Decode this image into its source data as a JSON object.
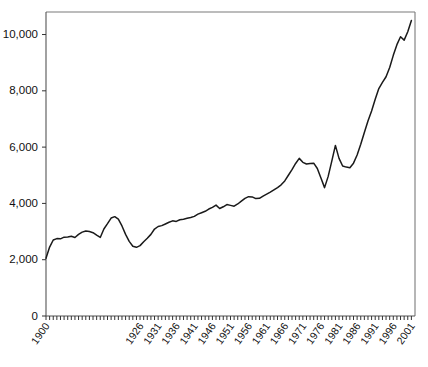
{
  "chart_data": {
    "type": "line",
    "title": "",
    "subtitle": "",
    "xlabel": "",
    "ylabel": "",
    "xlim": [
      1900,
      2002
    ],
    "ylim": [
      0,
      10800
    ],
    "grid": false,
    "legend": "none",
    "y_ticks": [
      0,
      2000,
      4000,
      6000,
      8000,
      10000
    ],
    "y_tick_labels": [
      "0",
      "2,000",
      "4,000",
      "6,000",
      "8,000",
      "10,000"
    ],
    "x_tick_labels": [
      "1900",
      "1926",
      "1931",
      "1936",
      "1941",
      "1946",
      "1951",
      "1956",
      "1961",
      "1966",
      "1971",
      "1976",
      "1981",
      "1986",
      "1991",
      "1996",
      "2001"
    ],
    "x_label_years": [
      1900,
      1926,
      1931,
      1936,
      1941,
      1946,
      1951,
      1956,
      1961,
      1966,
      1971,
      1976,
      1981,
      1986,
      1991,
      1996,
      2001
    ],
    "x_minor_tick_step": 1,
    "series": [
      {
        "name": "series-1",
        "color": "#1a1a1a",
        "x": [
          1900,
          1901,
          1902,
          1903,
          1904,
          1905,
          1906,
          1907,
          1908,
          1909,
          1910,
          1911,
          1912,
          1913,
          1914,
          1915,
          1916,
          1917,
          1918,
          1919,
          1920,
          1921,
          1922,
          1923,
          1924,
          1925,
          1926,
          1927,
          1928,
          1929,
          1930,
          1931,
          1932,
          1933,
          1934,
          1935,
          1936,
          1937,
          1938,
          1939,
          1940,
          1941,
          1942,
          1943,
          1944,
          1945,
          1946,
          1947,
          1948,
          1949,
          1950,
          1951,
          1952,
          1953,
          1954,
          1955,
          1956,
          1957,
          1958,
          1959,
          1960,
          1961,
          1962,
          1963,
          1964,
          1965,
          1966,
          1967,
          1968,
          1969,
          1970,
          1971,
          1972,
          1973,
          1974,
          1975,
          1976,
          1977,
          1978,
          1979,
          1980,
          1981,
          1982,
          1983,
          1984,
          1985,
          1986,
          1987,
          1988,
          1989,
          1990,
          1991,
          1992,
          1993,
          1994,
          1995,
          1996,
          1997,
          1998,
          1999,
          2000,
          2001
        ],
        "values": [
          2050,
          2450,
          2700,
          2750,
          2740,
          2800,
          2810,
          2830,
          2790,
          2900,
          2980,
          3020,
          3000,
          2960,
          2870,
          2790,
          3090,
          3280,
          3480,
          3530,
          3440,
          3200,
          2900,
          2650,
          2480,
          2440,
          2500,
          2640,
          2760,
          2900,
          3090,
          3180,
          3210,
          3270,
          3330,
          3380,
          3360,
          3420,
          3440,
          3470,
          3500,
          3540,
          3620,
          3670,
          3720,
          3800,
          3860,
          3940,
          3820,
          3880,
          3960,
          3930,
          3900,
          3980,
          4080,
          4180,
          4240,
          4230,
          4170,
          4180,
          4260,
          4330,
          4400,
          4480,
          4560,
          4660,
          4800,
          5000,
          5200,
          5420,
          5600,
          5460,
          5400,
          5420,
          5430,
          5240,
          4900,
          4560,
          4960,
          5500,
          6060,
          5600,
          5330,
          5290,
          5270,
          5430,
          5720,
          6100,
          6520,
          6930,
          7280,
          7700,
          8080,
          8300,
          8500,
          8830,
          9260,
          9640,
          9920,
          9800,
          10100,
          10500
        ]
      }
    ]
  },
  "axes": {
    "y_axis_name": "y-axis",
    "x_axis_name": "x-axis"
  }
}
